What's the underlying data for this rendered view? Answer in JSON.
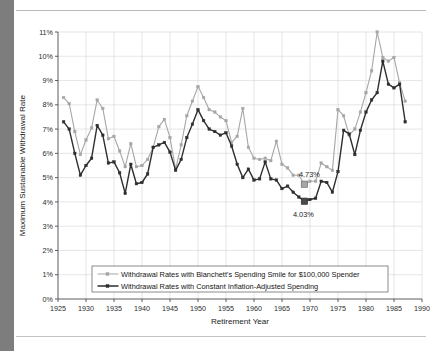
{
  "chart_data": {
    "type": "line",
    "title": "",
    "xlabel": "Retirement Year",
    "ylabel": "Maximum Sustainable Withdrawal Rate",
    "xlim": [
      1925,
      1990
    ],
    "ylim": [
      0,
      11
    ],
    "xticks": [
      1925,
      1930,
      1935,
      1940,
      1945,
      1950,
      1955,
      1960,
      1965,
      1970,
      1975,
      1980,
      1985,
      1990
    ],
    "xtick_labels": [
      "1925",
      "1930",
      "1935",
      "1940",
      "1945",
      "1950",
      "1955",
      "1960",
      "1965",
      "1970",
      "1975",
      "1980",
      "1985",
      "1990"
    ],
    "yticks": [
      0,
      1,
      2,
      3,
      4,
      5,
      6,
      7,
      8,
      9,
      10,
      11
    ],
    "ytick_labels": [
      "0%",
      "1%",
      "2%",
      "3%",
      "4%",
      "5%",
      "6%",
      "7%",
      "8%",
      "9%",
      "10%",
      "11%"
    ],
    "grid": true,
    "legend_position": "lower center",
    "x": [
      1926,
      1927,
      1928,
      1929,
      1930,
      1931,
      1932,
      1933,
      1934,
      1935,
      1936,
      1937,
      1938,
      1939,
      1940,
      1941,
      1942,
      1943,
      1944,
      1945,
      1946,
      1947,
      1948,
      1949,
      1950,
      1951,
      1952,
      1953,
      1954,
      1955,
      1956,
      1957,
      1958,
      1959,
      1960,
      1961,
      1962,
      1963,
      1964,
      1965,
      1966,
      1967,
      1968,
      1969,
      1970,
      1971,
      1972,
      1973,
      1974,
      1975,
      1976,
      1977,
      1978,
      1979,
      1980,
      1981,
      1982,
      1983,
      1984,
      1985,
      1986,
      1987
    ],
    "series": [
      {
        "name": "Withdrawal Rates with Blanchett's Spending Smile for $100,000 Spender",
        "color": "#a6a6a6",
        "marker": "square",
        "values": [
          8.3,
          8.05,
          6.9,
          5.95,
          6.55,
          7.05,
          8.2,
          7.85,
          6.6,
          6.7,
          6.1,
          5.45,
          6.4,
          5.45,
          5.5,
          5.75,
          6.25,
          7.1,
          7.4,
          6.65,
          5.35,
          6.35,
          7.55,
          8.15,
          8.75,
          8.3,
          7.8,
          7.7,
          7.5,
          7.35,
          6.45,
          6.7,
          7.85,
          6.25,
          5.8,
          5.75,
          5.8,
          5.7,
          6.5,
          5.55,
          5.4,
          5.1,
          5.1,
          4.73,
          4.85,
          4.85,
          5.6,
          5.45,
          5.3,
          7.8,
          7.55,
          6.75,
          7.0,
          7.7,
          8.5,
          9.4,
          11.0,
          9.95,
          9.8,
          9.95,
          8.9,
          8.15
        ]
      },
      {
        "name": "Withdrawal Rates with Constant Inflation-Adjusted Spending",
        "color": "#2e2e2e",
        "marker": "square",
        "values": [
          7.3,
          7.0,
          6.0,
          5.1,
          5.5,
          5.8,
          7.15,
          6.75,
          5.6,
          5.65,
          5.2,
          4.35,
          5.55,
          4.75,
          4.8,
          5.15,
          6.25,
          6.35,
          6.45,
          6.05,
          5.3,
          5.75,
          6.65,
          7.2,
          7.8,
          7.35,
          7.0,
          6.9,
          6.75,
          6.85,
          6.3,
          5.55,
          5.0,
          5.35,
          4.9,
          4.95,
          5.65,
          4.95,
          4.9,
          4.55,
          4.65,
          4.4,
          4.2,
          4.03,
          4.1,
          4.15,
          4.85,
          4.8,
          4.4,
          5.25,
          6.95,
          6.8,
          5.95,
          6.95,
          7.7,
          8.2,
          8.5,
          9.8,
          8.85,
          8.7,
          8.85,
          7.3
        ]
      }
    ],
    "annotations": [
      {
        "label": "4.73%",
        "x": 1969,
        "y": 4.73,
        "series": "Withdrawal Rates with Blanchett's Spending Smile for $100,000 Spender"
      },
      {
        "label": "4.03%",
        "x": 1969,
        "y": 4.03,
        "series": "Withdrawal Rates with Constant Inflation-Adjusted Spending"
      }
    ]
  },
  "legend": {
    "items": [
      {
        "label": "Withdrawal Rates with Blanchett's Spending Smile for $100,000 Spender"
      },
      {
        "label": "Withdrawal Rates with Constant Inflation-Adjusted Spending"
      }
    ]
  },
  "colors": {
    "smile_series": "#a6a6a6",
    "constant_series": "#2e2e2e",
    "grid": "#d5d5d5",
    "axis": "#4a4a4a",
    "gutter": "#7d7d7d",
    "rule": "#b9b9b9"
  }
}
